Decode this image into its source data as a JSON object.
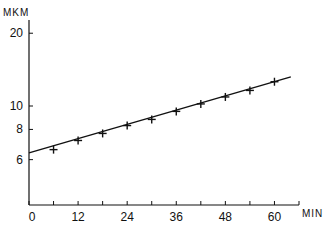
{
  "chart_data": {
    "type": "line",
    "title": "",
    "xlabel": "MIN",
    "ylabel": "MKM",
    "yscale": "log",
    "xlim": [
      0,
      66
    ],
    "ylim": [
      4.6,
      24
    ],
    "x_ticks": [
      0,
      6,
      12,
      18,
      24,
      30,
      36,
      42,
      48,
      54,
      60,
      66
    ],
    "x_tick_labels": [
      "0",
      "12",
      "24",
      "36",
      "48",
      "60"
    ],
    "x_tick_label_values": [
      0,
      12,
      24,
      36,
      48,
      60
    ],
    "y_tick_labels": [
      "6",
      "8",
      "10",
      "20"
    ],
    "y_tick_values": [
      6,
      8,
      10,
      20
    ],
    "grid": false,
    "legend": null,
    "series": [
      {
        "name": "measured",
        "marker": "+",
        "x": [
          6,
          12,
          18,
          24,
          30,
          36,
          42,
          48,
          54,
          60
        ],
        "values": [
          6.6,
          7.2,
          7.7,
          8.3,
          8.8,
          9.5,
          10.2,
          10.9,
          11.6,
          12.6
        ]
      },
      {
        "name": "fit-line",
        "marker": "none",
        "x": [
          0,
          64
        ],
        "values": [
          6.4,
          13.2
        ]
      }
    ]
  },
  "labels": {
    "y_unit": "MKM",
    "x_unit": "MIN"
  }
}
